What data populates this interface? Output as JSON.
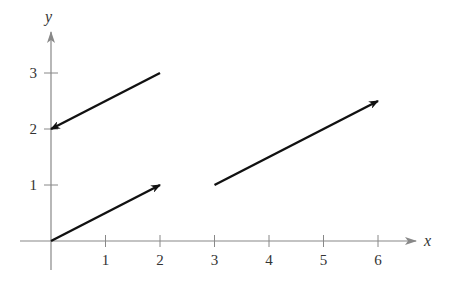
{
  "chart_data": {
    "type": "vector-plot",
    "title": "",
    "xlabel": "x",
    "ylabel": "y",
    "xlim": [
      0,
      6.7
    ],
    "ylim": [
      0,
      3.7
    ],
    "x_ticks": [
      1,
      2,
      3,
      4,
      5,
      6
    ],
    "y_ticks": [
      1,
      2,
      3
    ],
    "grid": false,
    "legend": null,
    "vectors": [
      {
        "name": "vector-a",
        "start": [
          2,
          3
        ],
        "end": [
          0,
          2
        ]
      },
      {
        "name": "vector-b",
        "start": [
          0,
          0
        ],
        "end": [
          2,
          1
        ]
      },
      {
        "name": "vector-c",
        "start": [
          3,
          1
        ],
        "end": [
          6,
          2.5
        ]
      }
    ]
  },
  "colors": {
    "axis": "#888888",
    "vector": "#111111",
    "text": "#333333"
  }
}
